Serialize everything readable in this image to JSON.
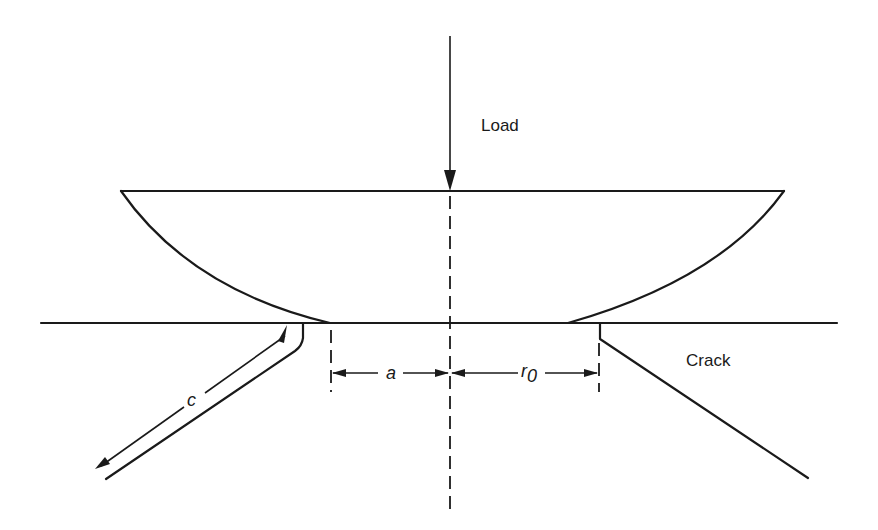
{
  "figure": {
    "type": "indentation-crack-diagram",
    "labels": {
      "load": "Load",
      "crack": "Crack",
      "a": "a",
      "r0_main": "r",
      "r0_sub": "0",
      "c": "c"
    },
    "colors": {
      "line": "#1a1a1a",
      "background": "#ffffff"
    },
    "elements": [
      "load-arrow",
      "indenter-lens",
      "specimen-surface",
      "center-axis",
      "dimension-a",
      "dimension-r0",
      "dimension-c",
      "left-crack",
      "right-crack"
    ]
  }
}
